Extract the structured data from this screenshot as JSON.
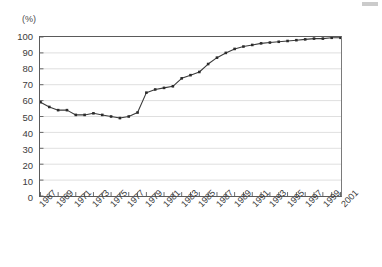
{
  "chart_data": {
    "type": "line",
    "title": "",
    "subtitle": "",
    "xlabel": "",
    "ylabel": "(%)",
    "unit_label": "(%)",
    "ylim": [
      0,
      100
    ],
    "xlim": [
      1967,
      2001
    ],
    "grid": true,
    "grid_axis": "y",
    "legend": false,
    "legend_position": "none",
    "marker": "filled-square",
    "line_color": "#3a3a3a",
    "marker_color": "#2b2b2b",
    "grid_color": "#d7d7d7",
    "axis_color": "#5a5a5a",
    "y_ticks": [
      0,
      10,
      20,
      30,
      40,
      50,
      60,
      70,
      80,
      90,
      100
    ],
    "y_tick_labels": [
      "0",
      "10",
      "20",
      "30",
      "40",
      "50",
      "60",
      "70",
      "80",
      "90",
      "100"
    ],
    "x_tick_labels": [
      "1967",
      "1969",
      "1971",
      "1973",
      "1975",
      "1977",
      "1979",
      "1981",
      "1983",
      "1985",
      "1987",
      "1989",
      "1991",
      "1993",
      "1995",
      "1997",
      "1999",
      "2001"
    ],
    "x_tick_label_interval": 2,
    "x": [
      1967,
      1968,
      1969,
      1970,
      1971,
      1972,
      1973,
      1974,
      1975,
      1976,
      1977,
      1978,
      1979,
      1980,
      1981,
      1982,
      1983,
      1984,
      1985,
      1986,
      1987,
      1988,
      1989,
      1990,
      1991,
      1992,
      1993,
      1994,
      1995,
      1996,
      1997,
      1998,
      1999,
      2000,
      2001
    ],
    "values": [
      59,
      56,
      54,
      54,
      51,
      51,
      52,
      51,
      50,
      49,
      50,
      52.5,
      65,
      67,
      68,
      69,
      74,
      76,
      78,
      83,
      87,
      90,
      92.5,
      94,
      95,
      96,
      96.5,
      97,
      97.5,
      98,
      98.5,
      99,
      99,
      99.5,
      99.5
    ],
    "series": [
      {
        "name": "",
        "values": [
          59,
          56,
          54,
          54,
          51,
          51,
          52,
          51,
          50,
          49,
          50,
          52.5,
          65,
          67,
          68,
          69,
          74,
          76,
          78,
          83,
          87,
          90,
          92.5,
          94,
          95,
          96,
          96.5,
          97,
          97.5,
          98,
          98.5,
          99,
          99,
          99.5,
          99.5
        ]
      }
    ]
  }
}
